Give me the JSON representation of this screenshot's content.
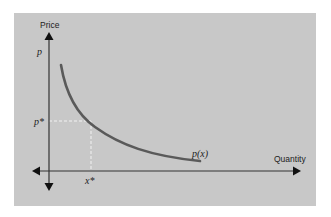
{
  "diagram": {
    "type": "demand-curve",
    "y_axis_label": "Price",
    "x_axis_label": "Quantity",
    "y_axis_symbol": "p",
    "equilibrium_price_label": "p*",
    "equilibrium_quantity_label": "x*",
    "curve_label": "p(x)",
    "colors": {
      "background": "#c8c8c8",
      "curve": "#5a5a5a",
      "axes": "#333333",
      "guides": "#f2f2f2"
    }
  }
}
